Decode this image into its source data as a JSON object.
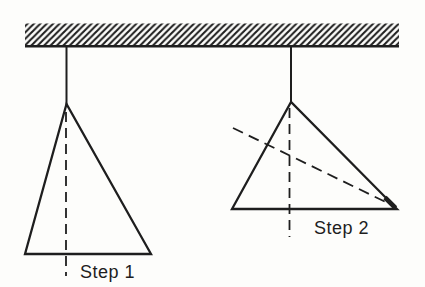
{
  "colors": {
    "paper": "#fdfdfb",
    "ink": "#1e1e1e"
  },
  "labels": {
    "step1": "Step 1",
    "step2": "Step 2"
  },
  "geometry": {
    "ceiling_hatch": {
      "x": "25",
      "y": "23.5",
      "width": "374",
      "height": "22"
    },
    "ceiling_base": {
      "x1": "25",
      "y1": "46.2",
      "x2": "399",
      "y2": "46.2"
    },
    "left_string": {
      "x1": "66.5",
      "y1": "46",
      "x2": "66.5",
      "y2": "105"
    },
    "left_triangle": {
      "points": "66.5,104 25,254 151,254"
    },
    "left_plumb": {
      "x1": "66",
      "y1": "112",
      "x2": "66",
      "y2": "276"
    },
    "step1_label": {
      "x": "80",
      "y": "278"
    },
    "right_string": {
      "x1": "291",
      "y1": "46",
      "x2": "291",
      "y2": "103"
    },
    "right_triangle": {
      "points": "291,102 232,209 397,209"
    },
    "right_plumb": {
      "x1": "289.5",
      "y1": "108",
      "x2": "289.5",
      "y2": "237"
    },
    "right_fold": {
      "x1": "233",
      "y1": "128",
      "x2": "396",
      "y2": "207"
    },
    "right_corner_thickening": {
      "x1": "385",
      "y1": "197.5",
      "x2": "395.5",
      "y2": "208"
    },
    "step2_label": {
      "x": "314",
      "y": "233.5"
    }
  }
}
